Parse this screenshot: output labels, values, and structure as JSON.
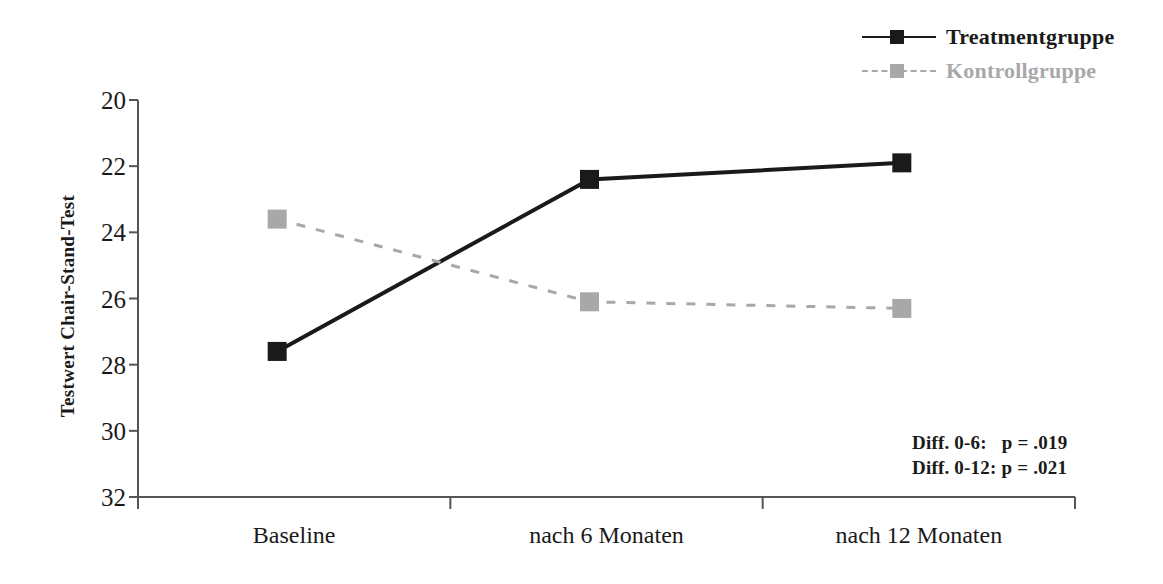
{
  "chart_data": {
    "type": "line",
    "title": "",
    "xlabel": "",
    "ylabel": "Testwert Chair-Stand-Test",
    "categories": [
      "Baseline",
      "nach 6 Monaten",
      "nach 12 Monaten"
    ],
    "ylim": [
      20,
      32
    ],
    "y_inverted": true,
    "yticks": [
      20,
      22,
      24,
      26,
      28,
      30,
      32
    ],
    "ytick_labels": [
      "20",
      "22",
      "24",
      "26",
      "28",
      "30",
      "32"
    ],
    "grid": false,
    "legend_position": "top-right",
    "series": [
      {
        "name": "Treatmentgruppe",
        "values": [
          27.6,
          22.4,
          21.9
        ],
        "color": "#1a1a1a",
        "line_style": "solid",
        "marker": "square"
      },
      {
        "name": "Kontrollgruppe",
        "values": [
          23.6,
          26.1,
          26.3
        ],
        "color": "#a8a8a8",
        "line_style": "dashed",
        "marker": "square"
      }
    ],
    "annotations": [
      "Diff. 0-6:   p = .019",
      "Diff. 0-12: p = .021"
    ]
  },
  "legend": {
    "items": [
      {
        "label": "Treatmentgruppe",
        "color": "#1a1a1a",
        "style": "solid"
      },
      {
        "label": "Kontrollgruppe",
        "color": "#a8a8a8",
        "style": "dashed"
      }
    ]
  },
  "axes": {
    "y_title": "Testwert Chair-Stand-Test",
    "y_labels": [
      "20",
      "22",
      "24",
      "26",
      "28",
      "30",
      "32"
    ],
    "x_labels": [
      "Baseline",
      "nach 6 Monaten",
      "nach 12 Monaten"
    ],
    "axis_color": "#555555"
  },
  "notes": {
    "line1": "Diff. 0-6:   p = .019",
    "line2": "Diff. 0-12: p = .021"
  }
}
